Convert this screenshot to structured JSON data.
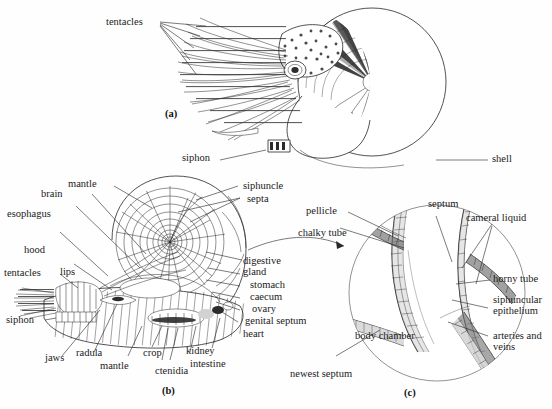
{
  "figure": {
    "panels": [
      {
        "id": "a",
        "caption": "(a)",
        "description": "external lateral view of living Nautilus"
      },
      {
        "id": "b",
        "caption": "(b)",
        "description": "median sagittal section of Nautilus showing internal organs and chambered shell"
      },
      {
        "id": "c",
        "caption": "(c)",
        "description": "enlarged detail of septum and siphuncle"
      }
    ]
  },
  "panel_a": {
    "caption": "(a)",
    "labels": [
      {
        "name": "tentacles",
        "text": "tentacles"
      },
      {
        "name": "siphon",
        "text": "siphon"
      },
      {
        "name": "shell",
        "text": "shell"
      }
    ]
  },
  "panel_b": {
    "caption": "(b)",
    "labels_left": [
      {
        "name": "mantle-top",
        "text": "mantle"
      },
      {
        "name": "brain",
        "text": "brain"
      },
      {
        "name": "esophagus",
        "text": "esophagus"
      },
      {
        "name": "hood",
        "text": "hood"
      },
      {
        "name": "lips",
        "text": "lips"
      },
      {
        "name": "tentacles",
        "text": "tentacles"
      },
      {
        "name": "siphon",
        "text": "siphon"
      }
    ],
    "labels_bottom": [
      {
        "name": "jaws",
        "text": "jaws"
      },
      {
        "name": "radula",
        "text": "radula"
      },
      {
        "name": "mantle-bottom",
        "text": "mantle"
      },
      {
        "name": "crop",
        "text": "crop"
      },
      {
        "name": "ctenidia",
        "text": "ctenidia"
      },
      {
        "name": "kidney",
        "text": "kidney"
      },
      {
        "name": "intestine",
        "text": "intestine"
      }
    ],
    "labels_right": [
      {
        "name": "siphuncle",
        "text": "siphuncle"
      },
      {
        "name": "septa",
        "text": "septa"
      },
      {
        "name": "digestive-gland",
        "text": "digestive gland"
      },
      {
        "name": "stomach",
        "text": "stomach"
      },
      {
        "name": "caecum",
        "text": "caecum"
      },
      {
        "name": "ovary",
        "text": "ovary"
      },
      {
        "name": "genital-septum",
        "text": "genital septum"
      },
      {
        "name": "heart",
        "text": "heart"
      }
    ]
  },
  "panel_c": {
    "caption": "(c)",
    "labels": [
      {
        "name": "pellicle",
        "text": "pellicle"
      },
      {
        "name": "chalky-tube",
        "text": "chalky tube"
      },
      {
        "name": "septum",
        "text": "septum"
      },
      {
        "name": "cameral-liquid",
        "text": "cameral liquid"
      },
      {
        "name": "horny-tube",
        "text": "horny tube"
      },
      {
        "name": "siphuncular-epithelium",
        "text": "siphuncular epithelium"
      },
      {
        "name": "arteries-and-veins",
        "text": "arteries and veins"
      },
      {
        "name": "body-chamber",
        "text": "body chamber"
      },
      {
        "name": "newest-septum",
        "text": "newest septum"
      }
    ]
  },
  "colors": {
    "background": "#fefefe",
    "ink": "#262626",
    "label_text": "#1a1a1a",
    "leader_line": "#2a2a2a",
    "shade_dark": "#2b2b2b",
    "shade_mid": "#6e6e6e",
    "shade_light": "#d2d2d2"
  }
}
